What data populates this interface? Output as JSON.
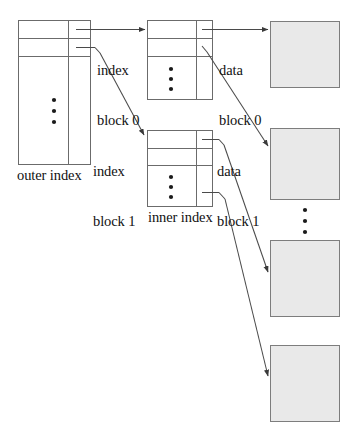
{
  "diagram": {
    "type": "block-pointer-diagram",
    "background_color": "#ffffff",
    "stroke_color": "#555555",
    "data_block_fill": "#e8e8e8",
    "text_color": "#111111"
  },
  "labels": {
    "outer_index": "outer index",
    "inner_index": "inner index",
    "index_block_0_line1": "index",
    "index_block_0_line2": "block 0",
    "index_block_1_line1": "index",
    "index_block_1_line2": "block 1",
    "data_block_0_line1": "data",
    "data_block_0_line2": "block 0",
    "data_block_1_line1": "data",
    "data_block_1_line2": "block 1"
  },
  "structures": {
    "outer_index": {
      "name": "outer index",
      "x": 18,
      "y": 20,
      "width": 73,
      "height": 145,
      "divider_x": 68,
      "row_lines_y": [
        38,
        56
      ],
      "ellipsis": true
    },
    "index_blocks": [
      {
        "name": "index block 0",
        "x": 147,
        "y": 20,
        "width": 66,
        "height": 80,
        "divider_x": 196,
        "row_lines_y": [
          38,
          56
        ],
        "ellipsis": true
      },
      {
        "name": "index block 1",
        "x": 147,
        "y": 130,
        "width": 66,
        "height": 77,
        "divider_x": 196,
        "row_lines_y": [
          148,
          165
        ],
        "ellipsis": true
      }
    ],
    "data_blocks": [
      {
        "name": "data block 0",
        "x": 270,
        "y": 21,
        "width": 70,
        "height": 67
      },
      {
        "name": "data block 1",
        "x": 270,
        "y": 128,
        "width": 70,
        "height": 72
      },
      {
        "name": "data block 2",
        "x": 270,
        "y": 240,
        "width": 70,
        "height": 77
      },
      {
        "name": "data block 3",
        "x": 270,
        "y": 345,
        "width": 70,
        "height": 77
      }
    ],
    "ellipses": [
      {
        "name": "outer-index-ellipsis",
        "cx": 54,
        "y_start": 100,
        "count": 3
      },
      {
        "name": "index-block-0-ellipsis",
        "cx": 171,
        "y_start": 68,
        "count": 3
      },
      {
        "name": "index-block-1-ellipsis",
        "cx": 171,
        "y_start": 176,
        "count": 3
      },
      {
        "name": "data-blocks-ellipsis",
        "cx": 305,
        "y_start": 210,
        "count": 3
      }
    ]
  },
  "connectors": [
    {
      "name": "outer-to-index-block-0",
      "from": "outer index row 1",
      "to": "index block 0",
      "style": "horizontal-arrow"
    },
    {
      "name": "outer-to-index-block-1",
      "from": "outer index row 2",
      "to": "index block 1",
      "style": "diagonal-arrow"
    },
    {
      "name": "index-block-0-to-data-block-0",
      "from": "index block 0 row 1",
      "to": "data block 0",
      "style": "horizontal-arrow"
    },
    {
      "name": "index-block-0-to-data-block-1",
      "from": "index block 0 row 2",
      "to": "data block 1",
      "style": "diagonal-arrow"
    },
    {
      "name": "index-block-1-to-data-block-2",
      "from": "index block 1 row 1",
      "to": "data block 2",
      "style": "diagonal-arrow"
    },
    {
      "name": "index-block-1-to-data-block-3",
      "from": "index block 1 last row",
      "to": "data block 3",
      "style": "diagonal-arrow"
    }
  ]
}
